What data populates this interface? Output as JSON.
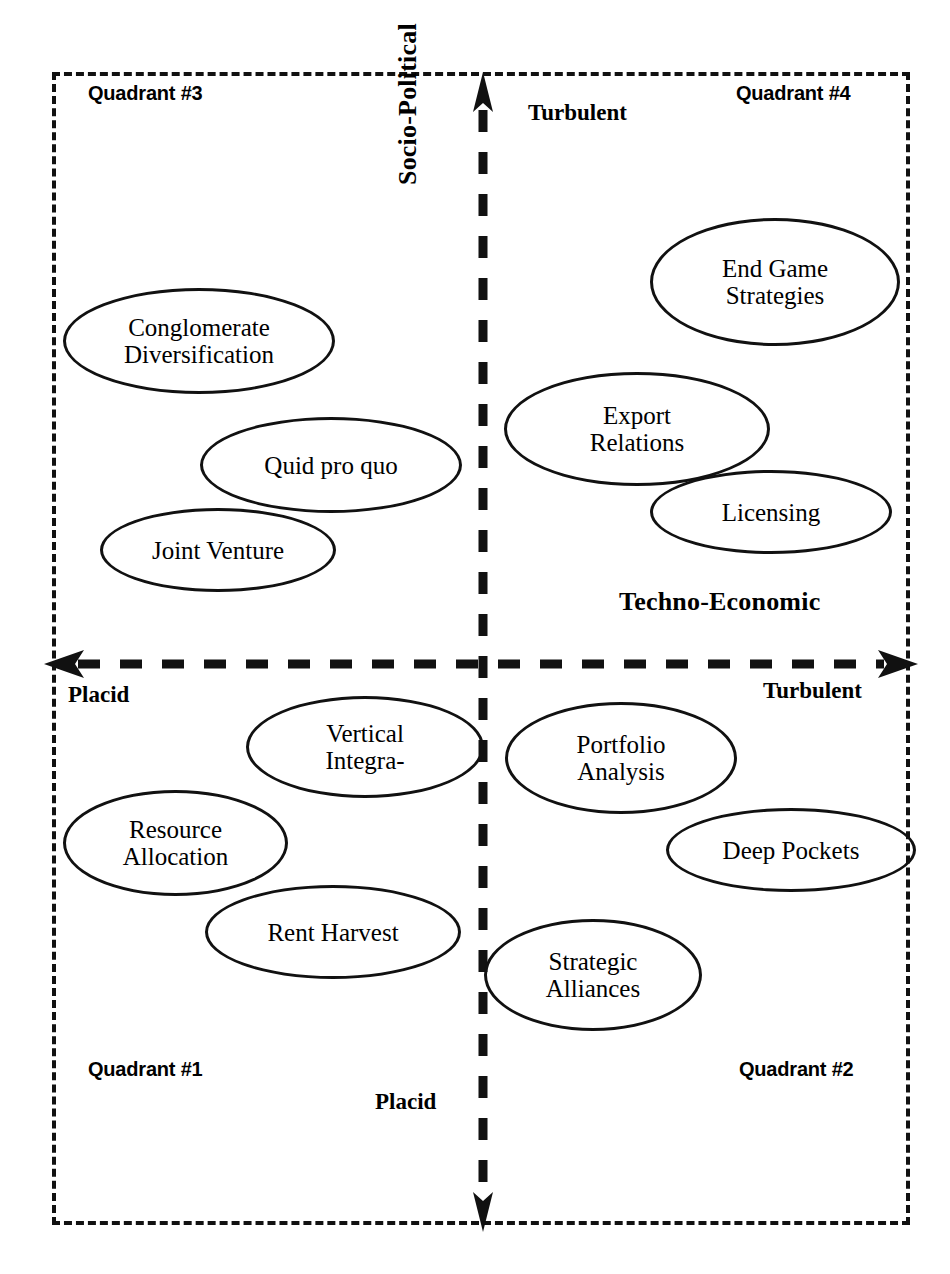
{
  "diagram": {
    "type": "quadrant-matrix",
    "frame": {
      "style": "dashed",
      "color": "#111111"
    },
    "axes": {
      "vertical": {
        "name": "socio-political-axis",
        "label": "Socio-Political",
        "top_end_label": "Turbulent",
        "bottom_end_label": "Placid",
        "arrow_top": true,
        "arrow_bottom": true,
        "style": "dashed"
      },
      "horizontal": {
        "name": "techno-economic-axis",
        "label": "Techno-Economic",
        "left_end_label": "Placid",
        "right_end_label": "Turbulent",
        "arrow_left": true,
        "arrow_right": true,
        "style": "dashed"
      }
    },
    "quadrants": [
      {
        "id": "q3",
        "label": "Quadrant #3",
        "position": "top-left",
        "socio_political": "Turbulent",
        "techno_economic": "Placid",
        "nodes": [
          {
            "id": "conglomerate",
            "lines": [
              "Conglomerate",
              "Diversification"
            ]
          },
          {
            "id": "quidproquo",
            "lines": [
              "Quid pro quo"
            ]
          },
          {
            "id": "jointventure",
            "lines": [
              "Joint Venture"
            ]
          }
        ]
      },
      {
        "id": "q4",
        "label": "Quadrant #4",
        "position": "top-right",
        "socio_political": "Turbulent",
        "techno_economic": "Turbulent",
        "nodes": [
          {
            "id": "endgame",
            "lines": [
              "End Game",
              "Strategies"
            ]
          },
          {
            "id": "export",
            "lines": [
              "Export",
              "Relations"
            ]
          },
          {
            "id": "licensing",
            "lines": [
              "Licensing"
            ]
          }
        ]
      },
      {
        "id": "q1",
        "label": "Quadrant #1",
        "position": "bottom-left",
        "socio_political": "Placid",
        "techno_economic": "Placid",
        "nodes": [
          {
            "id": "vertical",
            "lines": [
              "Vertical",
              "Integra-"
            ]
          },
          {
            "id": "resource",
            "lines": [
              "Resource",
              "Allocation"
            ]
          },
          {
            "id": "rentharvest",
            "lines": [
              "Rent Harvest"
            ]
          }
        ]
      },
      {
        "id": "q2",
        "label": "Quadrant #2",
        "position": "bottom-right",
        "socio_political": "Placid",
        "techno_economic": "Turbulent",
        "nodes": [
          {
            "id": "portfolio",
            "lines": [
              "Portfolio",
              "Analysis"
            ]
          },
          {
            "id": "deeppockets",
            "lines": [
              "Deep Pockets"
            ]
          },
          {
            "id": "strategic",
            "lines": [
              "Strategic",
              "Alliances"
            ]
          }
        ]
      }
    ]
  },
  "labels": {
    "quadrant3": "Quadrant #3",
    "quadrant4": "Quadrant #4",
    "quadrant1": "Quadrant #1",
    "quadrant2": "Quadrant #2",
    "turbulent_top": "Turbulent",
    "turbulent_right": "Turbulent",
    "placid_left": "Placid",
    "placid_bottom": "Placid",
    "socio_political": "Socio-Political",
    "techno_economic": "Techno-Economic"
  },
  "nodes": {
    "conglomerate": {
      "line1": "Conglomerate",
      "line2": "Diversification"
    },
    "quidproquo": {
      "line1": "Quid pro quo"
    },
    "jointventure": {
      "line1": "Joint Venture"
    },
    "endgame": {
      "line1": "End Game",
      "line2": "Strategies"
    },
    "export": {
      "line1": "Export",
      "line2": "Relations"
    },
    "licensing": {
      "line1": "Licensing"
    },
    "vertical": {
      "line1": "Vertical",
      "line2": "Integra-"
    },
    "resource": {
      "line1": "Resource",
      "line2": "Allocation"
    },
    "rentharvest": {
      "line1": "Rent Harvest"
    },
    "portfolio": {
      "line1": "Portfolio",
      "line2": "Analysis"
    },
    "deeppockets": {
      "line1": "Deep Pockets"
    },
    "strategic": {
      "line1": "Strategic",
      "line2": "Alliances"
    }
  },
  "colors": {
    "ink": "#111111",
    "background": "#ffffff"
  }
}
